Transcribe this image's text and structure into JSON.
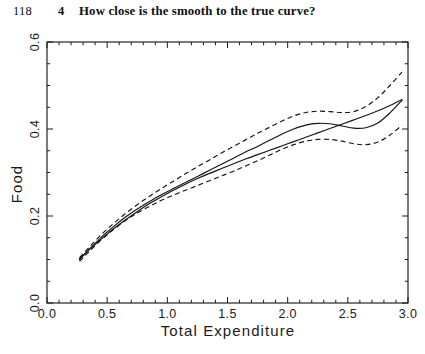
{
  "running_head": {
    "page_number": "118",
    "chapter_number": "4",
    "title": "How close is the smooth to the true curve?"
  },
  "chart_data": {
    "type": "line",
    "title": "",
    "xlabel": "Total Expenditure",
    "ylabel": "Food",
    "xlim": [
      0.0,
      3.0
    ],
    "ylim": [
      0.0,
      0.6
    ],
    "xticks": [
      0.0,
      0.5,
      1.0,
      1.5,
      2.0,
      2.5,
      3.0
    ],
    "xtick_labels": [
      "0.0",
      "0.5",
      "1.0",
      "1.5",
      "2.0",
      "2.5",
      "3.0"
    ],
    "yticks": [
      0.0,
      0.2,
      0.4,
      0.6
    ],
    "ytick_labels": [
      "0.0",
      "0.2",
      "0.4",
      "0.6"
    ],
    "minor_tick_step_x": 0.1,
    "minor_tick_step_y": 0.05,
    "grid": false,
    "legend": null,
    "tick_direction": "in",
    "frame": "box",
    "series": [
      {
        "name": "true curve",
        "style": "solid",
        "x": [
          0.27,
          0.35,
          0.45,
          0.55,
          0.65,
          0.75,
          0.85,
          0.95,
          1.05,
          1.15,
          1.25,
          1.35,
          1.45,
          1.55,
          1.65,
          1.75,
          1.85,
          1.95,
          2.05,
          2.15,
          2.25,
          2.35,
          2.45,
          2.55,
          2.65,
          2.75,
          2.85,
          2.95
        ],
        "y": [
          0.101,
          0.122,
          0.147,
          0.17,
          0.191,
          0.21,
          0.228,
          0.244,
          0.259,
          0.273,
          0.286,
          0.298,
          0.309,
          0.32,
          0.331,
          0.341,
          0.351,
          0.361,
          0.371,
          0.381,
          0.391,
          0.401,
          0.411,
          0.421,
          0.431,
          0.442,
          0.454,
          0.468
        ]
      },
      {
        "name": "smooth estimate",
        "style": "solid",
        "x": [
          0.27,
          0.35,
          0.45,
          0.55,
          0.65,
          0.75,
          0.85,
          0.95,
          1.05,
          1.15,
          1.25,
          1.35,
          1.45,
          1.55,
          1.65,
          1.75,
          1.85,
          1.95,
          2.05,
          2.15,
          2.25,
          2.35,
          2.45,
          2.55,
          2.65,
          2.75,
          2.85,
          2.95
        ],
        "y": [
          0.1,
          0.123,
          0.151,
          0.175,
          0.197,
          0.216,
          0.233,
          0.249,
          0.263,
          0.277,
          0.291,
          0.305,
          0.319,
          0.333,
          0.347,
          0.36,
          0.374,
          0.388,
          0.4,
          0.409,
          0.413,
          0.412,
          0.407,
          0.402,
          0.403,
          0.414,
          0.437,
          0.466
        ]
      },
      {
        "name": "upper confidence band",
        "style": "dashed",
        "x": [
          0.27,
          0.35,
          0.45,
          0.55,
          0.65,
          0.75,
          0.85,
          0.95,
          1.05,
          1.15,
          1.25,
          1.35,
          1.45,
          1.55,
          1.65,
          1.75,
          1.85,
          1.95,
          2.05,
          2.15,
          2.25,
          2.35,
          2.45,
          2.55,
          2.65,
          2.75,
          2.85,
          2.95
        ],
        "y": [
          0.104,
          0.128,
          0.157,
          0.182,
          0.205,
          0.226,
          0.245,
          0.263,
          0.28,
          0.297,
          0.313,
          0.329,
          0.345,
          0.36,
          0.375,
          0.39,
          0.404,
          0.418,
          0.43,
          0.438,
          0.441,
          0.44,
          0.438,
          0.44,
          0.452,
          0.472,
          0.5,
          0.531
        ]
      },
      {
        "name": "lower confidence band",
        "style": "dashed",
        "x": [
          0.27,
          0.35,
          0.45,
          0.55,
          0.65,
          0.75,
          0.85,
          0.95,
          1.05,
          1.15,
          1.25,
          1.35,
          1.45,
          1.55,
          1.65,
          1.75,
          1.85,
          1.95,
          2.05,
          2.15,
          2.25,
          2.35,
          2.45,
          2.55,
          2.65,
          2.75,
          2.85,
          2.95
        ],
        "y": [
          0.096,
          0.118,
          0.145,
          0.168,
          0.189,
          0.207,
          0.222,
          0.236,
          0.248,
          0.259,
          0.27,
          0.281,
          0.292,
          0.303,
          0.315,
          0.327,
          0.34,
          0.353,
          0.364,
          0.372,
          0.376,
          0.376,
          0.372,
          0.366,
          0.364,
          0.37,
          0.386,
          0.409
        ]
      }
    ]
  }
}
